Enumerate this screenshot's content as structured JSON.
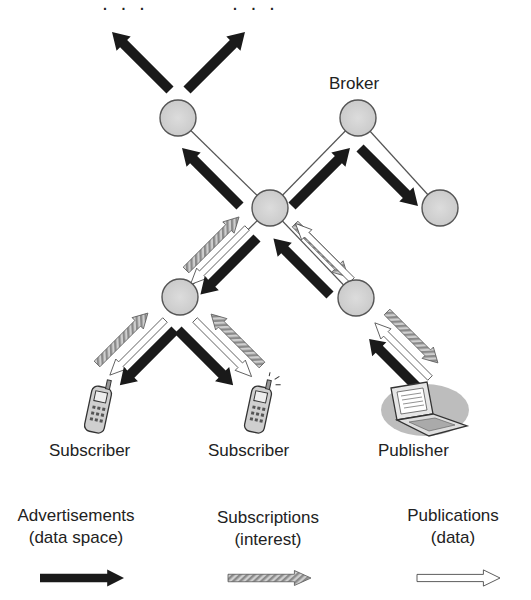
{
  "diagram": {
    "type": "publish-subscribe broker network",
    "top_ellipses": [
      "· · ·",
      "· · ·"
    ],
    "node_label": "Broker",
    "endpoints": [
      {
        "label": "Subscriber",
        "icon": "mobile-phone-icon"
      },
      {
        "label": "Subscriber",
        "icon": "mobile-phone-icon"
      },
      {
        "label": "Publisher",
        "icon": "laptop-icon"
      }
    ],
    "nodes": [
      {
        "id": "broker-top-left",
        "x": 178,
        "y": 118
      },
      {
        "id": "broker-top-right",
        "x": 358,
        "y": 118,
        "labeled": true
      },
      {
        "id": "broker-right",
        "x": 440,
        "y": 208
      },
      {
        "id": "broker-center",
        "x": 270,
        "y": 208
      },
      {
        "id": "broker-lower-left",
        "x": 180,
        "y": 297
      },
      {
        "id": "broker-lower-right",
        "x": 356,
        "y": 298
      }
    ],
    "colors": {
      "node_fill": "#d4d4d4",
      "node_stroke": "#555555",
      "advertisement_arrow": "#1a1a1a",
      "subscription_arrow": "#bdbdbd",
      "publication_arrow": "#ffffff"
    }
  },
  "legend": {
    "items": [
      {
        "title": "Advertisements",
        "subtitle": "(data space)",
        "style": "solid-black-arrow"
      },
      {
        "title": "Subscriptions",
        "subtitle": "(interest)",
        "style": "hatched-gray-arrow"
      },
      {
        "title": "Publications",
        "subtitle": "(data)",
        "style": "outlined-white-arrow"
      }
    ]
  }
}
